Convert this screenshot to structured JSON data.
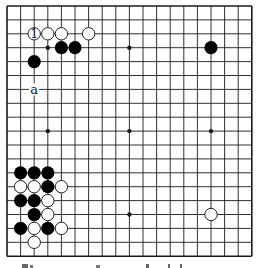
{
  "diagram": {
    "type": "go-board",
    "size": 19,
    "origin": {
      "x": 7,
      "y": 6
    },
    "spacing": {
      "x": 13.6,
      "y": 13.9
    },
    "colors": {
      "line": "#1a1a1a",
      "black_stone": "#000000",
      "white_stone_fill": "#ffffff",
      "white_stone_stroke": "#222222",
      "background": "#ffffff"
    },
    "star_points": [
      [
        3,
        3
      ],
      [
        9,
        3
      ],
      [
        15,
        3
      ],
      [
        3,
        9
      ],
      [
        9,
        9
      ],
      [
        15,
        9
      ],
      [
        3,
        15
      ],
      [
        9,
        15
      ],
      [
        15,
        15
      ]
    ],
    "stones": [
      {
        "color": "white",
        "col": 2,
        "row": 2,
        "label": "1"
      },
      {
        "color": "white",
        "col": 3,
        "row": 2
      },
      {
        "color": "white",
        "col": 4,
        "row": 2
      },
      {
        "color": "white",
        "col": 6,
        "row": 2
      },
      {
        "color": "black",
        "col": 4,
        "row": 3
      },
      {
        "color": "black",
        "col": 5,
        "row": 3
      },
      {
        "color": "black",
        "col": 2,
        "row": 4
      },
      {
        "color": "black",
        "col": 15,
        "row": 3
      },
      {
        "color": "black",
        "col": 1,
        "row": 12
      },
      {
        "color": "black",
        "col": 2,
        "row": 12
      },
      {
        "color": "black",
        "col": 3,
        "row": 12
      },
      {
        "color": "white",
        "col": 1,
        "row": 13
      },
      {
        "color": "white",
        "col": 2,
        "row": 13
      },
      {
        "color": "black",
        "col": 3,
        "row": 13
      },
      {
        "color": "white",
        "col": 4,
        "row": 13
      },
      {
        "color": "black",
        "col": 1,
        "row": 14
      },
      {
        "color": "black",
        "col": 2,
        "row": 14
      },
      {
        "color": "white",
        "col": 3,
        "row": 14
      },
      {
        "color": "black",
        "col": 2,
        "row": 15
      },
      {
        "color": "white",
        "col": 3,
        "row": 15
      },
      {
        "color": "black",
        "col": 1,
        "row": 16
      },
      {
        "color": "white",
        "col": 2,
        "row": 16
      },
      {
        "color": "black",
        "col": 3,
        "row": 16
      },
      {
        "color": "white",
        "col": 4,
        "row": 16
      },
      {
        "color": "white",
        "col": 2,
        "row": 17
      },
      {
        "color": "white",
        "col": 15,
        "row": 15
      }
    ],
    "labels": [
      {
        "text": "a",
        "col": 2,
        "row": 6
      }
    ]
  }
}
